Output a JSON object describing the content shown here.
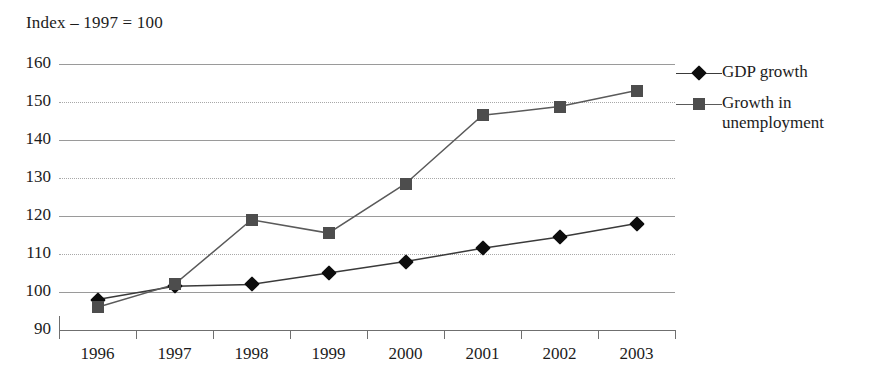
{
  "chart_data": {
    "type": "line",
    "title": "Index – 1997 = 100",
    "xlabel": "",
    "ylabel": "",
    "categories": [
      "1996",
      "1997",
      "1998",
      "1999",
      "2000",
      "2001",
      "2002",
      "2003"
    ],
    "ylim": [
      90,
      160
    ],
    "yticks": [
      90,
      100,
      110,
      120,
      130,
      140,
      150,
      160
    ],
    "ytick_labels": [
      "90",
      "100",
      "110",
      "120",
      "130",
      "140",
      "150",
      "160"
    ],
    "grid": true,
    "legend_position": "right",
    "series": [
      {
        "name": "GDP growth",
        "marker": "diamond",
        "color": "#0d0d0d",
        "line_color": "#3a3a3a",
        "values": [
          98,
          101.5,
          102,
          105,
          108,
          111.5,
          114.5,
          118
        ]
      },
      {
        "name": "Growth in unemployment",
        "marker": "square",
        "color": "#4d4d4d",
        "line_color": "#5a5a5a",
        "values": [
          96,
          102,
          119,
          115.5,
          128.5,
          146.5,
          148.8,
          153
        ]
      }
    ]
  },
  "legend": {
    "entries": [
      {
        "label": "GDP growth"
      },
      {
        "label": "Growth in unemployment"
      }
    ]
  },
  "colors": {
    "gridline": "#9a9a9a",
    "axis": "#6f6f6f",
    "text": "#1c1c1c",
    "background": "#ffffff"
  }
}
